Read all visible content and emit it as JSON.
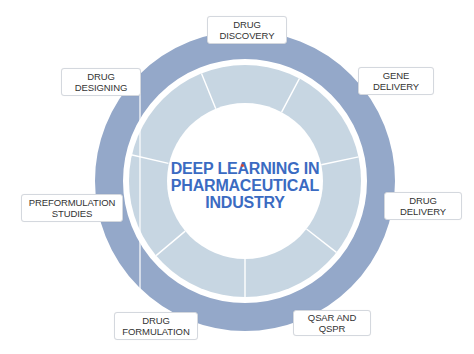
{
  "diagram": {
    "center_title_lines": [
      "DEEP LEARNING IN",
      "PHARMACEUTICAL",
      "INDUSTRY"
    ],
    "colors": {
      "outer_ring": "#94a8c9",
      "inner_segments": "#c7d6e2",
      "center_fill": "#ffffff",
      "title_text": "#3b6bc2",
      "label_text": "#333333",
      "accent_dot": "#d9482b"
    },
    "labels": [
      {
        "id": "drug-discovery",
        "lines": [
          "DRUG",
          "DISCOVERY"
        ]
      },
      {
        "id": "gene-delivery",
        "lines": [
          "GENE",
          "DELIVERY"
        ]
      },
      {
        "id": "drug-delivery",
        "lines": [
          "DRUG",
          "DELIVERY"
        ]
      },
      {
        "id": "qsar-and-qspr",
        "lines": [
          "QSAR AND QSPR"
        ]
      },
      {
        "id": "drug-formulation",
        "lines": [
          "DRUG",
          "FORMULATION"
        ]
      },
      {
        "id": "preformulation-studies",
        "lines": [
          "PREFORMULATION",
          "STUDIES"
        ]
      },
      {
        "id": "drug-designing",
        "lines": [
          "DRUG",
          "DESIGNING"
        ]
      }
    ]
  }
}
